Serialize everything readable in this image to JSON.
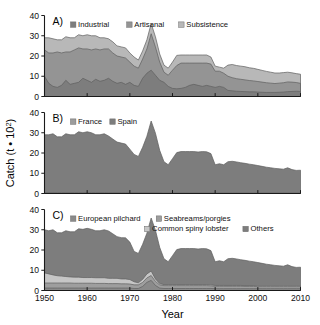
{
  "figure": {
    "xlabel": "Year",
    "ylabel_main": "Catch (t ",
    "ylabel_dot": "•",
    "ylabel_unit": "10",
    "ylabel_exp": "2",
    "ylabel_close": ")",
    "ylabel_full": "Catch (t • 10²)",
    "background": "#ffffff",
    "axis_color": "#1a1a1a"
  },
  "axes": {
    "x": {
      "min": 1950,
      "max": 2010,
      "ticks": [
        1950,
        1960,
        1970,
        1980,
        1990,
        2000,
        2010
      ],
      "ticklabels": [
        "1950",
        "1960",
        "1970",
        "1980",
        "1990",
        "2000",
        "2010"
      ]
    },
    "y": {
      "min": 0,
      "max": 40,
      "ticks": [
        0,
        10,
        20,
        30,
        40
      ],
      "ticklabels": [
        "0",
        "10",
        "20",
        "30",
        "40"
      ]
    }
  },
  "palette": {
    "dark_gray": "#7d7d7d",
    "mid_gray": "#949494",
    "light_gray": "#b4b4b4",
    "pale_gray": "#c9c9c9",
    "line_dark": "#5e5e5e"
  },
  "panels": [
    {
      "letter": "A)",
      "legend": [
        "Industrial",
        "Artisanal",
        "Subsistence"
      ]
    },
    {
      "letter": "B)",
      "legend": [
        "France",
        "Spain"
      ]
    },
    {
      "letter": "C)",
      "legend": [
        "European pilchard",
        "Seabreams/porgies",
        "Common spiny lobster",
        "Others"
      ]
    }
  ],
  "chart_data": [
    {
      "type": "area",
      "stacked": true,
      "panel": "A",
      "title": "",
      "xlabel": "Year",
      "ylabel": "Catch (t • 10²)",
      "xlim": [
        1950,
        2010
      ],
      "ylim": [
        0,
        40
      ],
      "grid": false,
      "legend_position": "top",
      "x": [
        1950,
        1951,
        1952,
        1953,
        1954,
        1955,
        1956,
        1957,
        1958,
        1959,
        1960,
        1961,
        1962,
        1963,
        1964,
        1965,
        1966,
        1967,
        1968,
        1969,
        1970,
        1971,
        1972,
        1973,
        1974,
        1975,
        1976,
        1977,
        1978,
        1979,
        1980,
        1981,
        1982,
        1983,
        1984,
        1985,
        1986,
        1987,
        1988,
        1989,
        1990,
        1991,
        1992,
        1993,
        1994,
        1995,
        1996,
        1997,
        1998,
        1999,
        2000,
        2001,
        2002,
        2003,
        2004,
        2005,
        2006,
        2007,
        2008,
        2009,
        2010
      ],
      "series": [
        {
          "name": "Industrial",
          "color": "#7d7d7d",
          "values": [
            10.0,
            6.5,
            5.0,
            4.5,
            5.5,
            8.0,
            6.0,
            6.5,
            7.0,
            9.0,
            8.0,
            7.0,
            8.5,
            7.5,
            8.0,
            9.0,
            7.5,
            6.5,
            7.0,
            6.0,
            7.0,
            5.5,
            5.0,
            9.0,
            11.5,
            13.0,
            10.5,
            8.0,
            7.0,
            5.0,
            4.0,
            3.8,
            4.0,
            4.5,
            5.5,
            6.0,
            5.5,
            5.0,
            5.5,
            5.0,
            4.5,
            5.0,
            4.5,
            3.0,
            2.8,
            2.6,
            2.5,
            2.4,
            2.3,
            2.3,
            2.2,
            2.1,
            2.0,
            2.0,
            2.0,
            2.1,
            2.2,
            2.4,
            2.5,
            2.6,
            2.5
          ]
        },
        {
          "name": "Artisanal",
          "color": "#949494",
          "values": [
            13.0,
            15.0,
            16.5,
            17.5,
            16.0,
            14.0,
            16.0,
            16.5,
            17.0,
            14.5,
            15.5,
            16.0,
            15.0,
            15.5,
            15.5,
            14.5,
            14.0,
            13.5,
            12.5,
            13.0,
            10.0,
            9.5,
            9.0,
            9.5,
            12.0,
            18.0,
            14.0,
            9.0,
            5.0,
            5.5,
            9.0,
            11.5,
            12.5,
            12.0,
            11.0,
            10.5,
            11.0,
            11.5,
            11.0,
            11.0,
            8.0,
            7.5,
            7.0,
            7.0,
            6.5,
            6.2,
            6.0,
            5.8,
            5.6,
            5.4,
            5.2,
            5.0,
            4.8,
            4.6,
            4.4,
            4.5,
            4.6,
            4.8,
            4.6,
            4.3,
            4.0
          ]
        },
        {
          "name": "Subsistence",
          "color": "#b8b8b8",
          "values": [
            6.0,
            7.5,
            7.0,
            6.0,
            6.5,
            7.5,
            7.0,
            6.0,
            6.5,
            6.5,
            7.0,
            7.0,
            6.5,
            6.0,
            5.5,
            5.0,
            5.5,
            5.0,
            5.0,
            5.0,
            4.5,
            4.5,
            4.0,
            4.0,
            4.5,
            5.0,
            5.0,
            4.0,
            3.5,
            3.5,
            4.0,
            5.0,
            4.0,
            4.0,
            4.0,
            4.0,
            4.0,
            4.0,
            4.0,
            3.5,
            2.5,
            2.0,
            2.5,
            5.5,
            6.5,
            6.5,
            6.5,
            6.5,
            6.3,
            6.2,
            6.0,
            5.8,
            5.6,
            5.4,
            5.2,
            5.0,
            5.0,
            4.8,
            4.6,
            4.4,
            4.5
          ]
        }
      ]
    },
    {
      "type": "area",
      "stacked": true,
      "panel": "B",
      "title": "",
      "xlabel": "Year",
      "ylabel": "Catch (t • 10²)",
      "xlim": [
        1950,
        2010
      ],
      "ylim": [
        0,
        40
      ],
      "grid": false,
      "legend_position": "top",
      "x": [
        1950,
        1951,
        1952,
        1953,
        1954,
        1955,
        1956,
        1957,
        1958,
        1959,
        1960,
        1961,
        1962,
        1963,
        1964,
        1965,
        1966,
        1967,
        1968,
        1969,
        1970,
        1971,
        1972,
        1973,
        1974,
        1975,
        1976,
        1977,
        1978,
        1979,
        1980,
        1981,
        1982,
        1983,
        1984,
        1985,
        1986,
        1987,
        1988,
        1989,
        1990,
        1991,
        1992,
        1993,
        1994,
        1995,
        1996,
        1997,
        1998,
        1999,
        2000,
        2001,
        2002,
        2003,
        2004,
        2005,
        2006,
        2007,
        2008,
        2009,
        2010
      ],
      "series": [
        {
          "name": "France",
          "color": "#9c9c9c",
          "values": [
            0.5,
            0.5,
            0.5,
            0.5,
            0.5,
            0.5,
            0.5,
            0.5,
            0.5,
            0.5,
            0.5,
            0.5,
            0.5,
            0.5,
            0.5,
            0.4,
            0.4,
            0.4,
            0.4,
            0.4,
            0.4,
            0.3,
            0.3,
            0.3,
            0.3,
            0.3,
            0.3,
            0.3,
            0.2,
            0.2,
            0.2,
            0.2,
            0.2,
            0.2,
            0.2,
            0.2,
            0.2,
            0.2,
            0.2,
            0.2,
            0.2,
            0.2,
            0.2,
            0.2,
            0.2,
            0.2,
            0.2,
            0.2,
            0.2,
            0.2,
            0.2,
            0.2,
            0.2,
            0.2,
            0.2,
            0.2,
            0.2,
            0.2,
            0.2,
            0.2,
            0.2
          ]
        },
        {
          "name": "Spain",
          "color": "#7d7d7d",
          "values": [
            28.5,
            28.5,
            29.0,
            27.5,
            27.5,
            29.0,
            28.5,
            28.5,
            30.0,
            29.5,
            30.0,
            29.5,
            28.5,
            28.5,
            29.0,
            28.0,
            26.5,
            25.0,
            24.5,
            24.0,
            21.5,
            19.0,
            18.0,
            22.5,
            28.0,
            35.5,
            29.5,
            21.0,
            15.5,
            14.0,
            17.0,
            20.0,
            20.5,
            20.5,
            20.5,
            20.5,
            20.3,
            20.5,
            20.4,
            19.5,
            14.0,
            14.5,
            14.0,
            15.5,
            15.7,
            15.4,
            15.0,
            14.7,
            14.3,
            14.0,
            13.6,
            13.2,
            12.8,
            12.5,
            12.2,
            12.0,
            11.8,
            12.5,
            11.6,
            11.2,
            11.3
          ]
        }
      ]
    },
    {
      "type": "area",
      "stacked": true,
      "panel": "C",
      "title": "",
      "xlabel": "Year",
      "ylabel": "Catch (t • 10²)",
      "xlim": [
        1950,
        2010
      ],
      "ylim": [
        0,
        40
      ],
      "grid": false,
      "legend_position": "top",
      "x": [
        1950,
        1951,
        1952,
        1953,
        1954,
        1955,
        1956,
        1957,
        1958,
        1959,
        1960,
        1961,
        1962,
        1963,
        1964,
        1965,
        1966,
        1967,
        1968,
        1969,
        1970,
        1971,
        1972,
        1973,
        1974,
        1975,
        1976,
        1977,
        1978,
        1979,
        1980,
        1981,
        1982,
        1983,
        1984,
        1985,
        1986,
        1987,
        1988,
        1989,
        1990,
        1991,
        1992,
        1993,
        1994,
        1995,
        1996,
        1997,
        1998,
        1999,
        2000,
        2001,
        2002,
        2003,
        2004,
        2005,
        2006,
        2007,
        2008,
        2009,
        2010
      ],
      "series": [
        {
          "name": "European pilchard",
          "color": "#8a8a8a",
          "values": [
            1.2,
            1.2,
            1.2,
            1.2,
            1.2,
            1.2,
            1.2,
            1.2,
            1.2,
            1.2,
            1.2,
            1.2,
            1.2,
            1.2,
            1.2,
            1.2,
            1.2,
            1.2,
            1.2,
            1.2,
            1.2,
            1.0,
            1.0,
            2.0,
            4.0,
            5.0,
            2.5,
            1.2,
            1.0,
            1.0,
            1.0,
            1.0,
            1.0,
            1.0,
            1.0,
            1.0,
            1.0,
            1.0,
            1.0,
            1.0,
            0.9,
            0.9,
            0.9,
            0.9,
            0.9,
            0.9,
            0.9,
            0.9,
            0.9,
            0.9,
            0.9,
            0.9,
            0.9,
            0.9,
            0.9,
            0.9,
            0.9,
            0.9,
            0.9,
            0.9,
            0.9
          ]
        },
        {
          "name": "Seabreams/porgies",
          "color": "#9e9e9e",
          "values": [
            2.5,
            2.5,
            2.5,
            2.5,
            2.5,
            2.5,
            2.5,
            2.4,
            2.4,
            2.4,
            2.4,
            2.4,
            2.3,
            2.3,
            2.3,
            2.2,
            2.2,
            2.2,
            2.1,
            2.1,
            2.0,
            1.8,
            1.8,
            2.0,
            2.2,
            2.4,
            2.0,
            1.6,
            1.4,
            1.4,
            1.4,
            1.4,
            1.4,
            1.4,
            1.4,
            1.4,
            1.4,
            1.4,
            1.4,
            1.3,
            1.2,
            1.2,
            1.2,
            1.2,
            1.2,
            1.2,
            1.2,
            1.1,
            1.1,
            1.1,
            1.0,
            1.0,
            1.0,
            1.0,
            1.0,
            1.0,
            1.0,
            1.0,
            1.0,
            1.0,
            1.0
          ]
        },
        {
          "name": "Common spiny lobster",
          "color": "#c6c6c6",
          "values": [
            5.0,
            4.5,
            4.0,
            3.6,
            3.4,
            3.2,
            3.0,
            3.0,
            3.0,
            2.8,
            2.8,
            2.8,
            2.8,
            2.8,
            2.8,
            2.6,
            2.6,
            2.6,
            2.4,
            2.4,
            2.2,
            1.5,
            1.0,
            1.5,
            2.0,
            2.2,
            1.2,
            0.6,
            0.5,
            0.5,
            0.5,
            0.5,
            0.5,
            0.5,
            0.5,
            0.5,
            0.5,
            0.5,
            0.5,
            0.5,
            0.4,
            0.4,
            0.4,
            0.4,
            0.4,
            0.4,
            0.4,
            0.4,
            0.4,
            0.4,
            0.4,
            0.4,
            0.4,
            0.4,
            0.4,
            0.4,
            0.4,
            0.4,
            0.4,
            0.4,
            0.4
          ]
        },
        {
          "name": "Others",
          "color": "#7d7d7d",
          "values": [
            21.3,
            21.3,
            22.3,
            21.2,
            21.4,
            22.6,
            22.3,
            22.4,
            23.9,
            23.8,
            24.3,
            23.8,
            23.2,
            23.2,
            23.7,
            23.4,
            22.0,
            20.6,
            20.4,
            20.3,
            18.5,
            15.0,
            14.5,
            17.3,
            20.1,
            26.2,
            24.1,
            17.9,
            12.8,
            11.3,
            14.3,
            17.3,
            17.8,
            17.8,
            17.8,
            17.8,
            17.6,
            17.8,
            17.7,
            16.9,
            11.7,
            12.2,
            11.7,
            13.2,
            13.4,
            13.1,
            12.7,
            12.5,
            12.1,
            11.8,
            11.5,
            11.1,
            10.7,
            10.4,
            10.1,
            9.9,
            9.7,
            10.4,
            9.5,
            9.1,
            9.2
          ]
        }
      ]
    }
  ]
}
